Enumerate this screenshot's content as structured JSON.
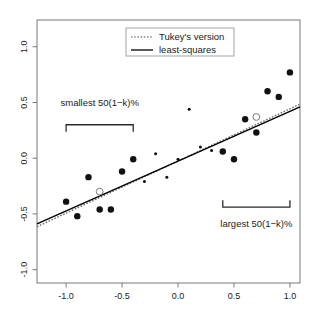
{
  "chart_data": {
    "type": "scatter",
    "title": "",
    "xlabel": "",
    "ylabel": "",
    "xlim": [
      -1.26,
      1.09
    ],
    "ylim": [
      -1.12,
      1.24
    ],
    "grid": false,
    "xticks": [
      -1.0,
      -0.5,
      0.0,
      0.5,
      1.0
    ],
    "xticklabels": [
      "-1.0",
      "-0.5",
      "0.0",
      "0.5",
      "1.0"
    ],
    "yticks": [
      -1.0,
      -0.5,
      0.0,
      0.5,
      1.0
    ],
    "yticklabels": [
      "-1.0",
      "-0.5",
      "0.0",
      "0.5",
      "1.0"
    ],
    "legend": {
      "position": "top-center",
      "entries": [
        {
          "label": "Tukey's version",
          "style": "dotted",
          "color": "#8c8c8c"
        },
        {
          "label": "least-squares",
          "style": "solid",
          "color": "#000000"
        }
      ]
    },
    "series": [
      {
        "name": "large-points",
        "marker": "filled-circle",
        "size": "large",
        "color": "#111111",
        "points": [
          {
            "x": -1.0,
            "y": -0.39
          },
          {
            "x": -0.9,
            "y": -0.52
          },
          {
            "x": -0.8,
            "y": -0.17
          },
          {
            "x": -0.7,
            "y": -0.46
          },
          {
            "x": -0.6,
            "y": -0.46
          },
          {
            "x": -0.5,
            "y": -0.12
          },
          {
            "x": -0.4,
            "y": -0.01
          },
          {
            "x": 0.4,
            "y": 0.06
          },
          {
            "x": 0.5,
            "y": -0.01
          },
          {
            "x": 0.6,
            "y": 0.35
          },
          {
            "x": 0.7,
            "y": 0.23
          },
          {
            "x": 0.8,
            "y": 0.6
          },
          {
            "x": 0.9,
            "y": 0.55
          },
          {
            "x": 1.0,
            "y": 0.77
          }
        ]
      },
      {
        "name": "small-points",
        "marker": "filled-circle",
        "size": "small",
        "color": "#111111",
        "points": [
          {
            "x": -0.3,
            "y": -0.21
          },
          {
            "x": -0.2,
            "y": 0.04
          },
          {
            "x": -0.1,
            "y": -0.17
          },
          {
            "x": 0.0,
            "y": -0.01
          },
          {
            "x": 0.1,
            "y": 0.44
          },
          {
            "x": 0.2,
            "y": 0.1
          },
          {
            "x": 0.3,
            "y": 0.07
          }
        ]
      },
      {
        "name": "centroid-markers",
        "marker": "open-circle",
        "color": "#7a7a7a",
        "points": [
          {
            "x": -0.7,
            "y": -0.3
          },
          {
            "x": 0.7,
            "y": 0.37
          }
        ]
      }
    ],
    "lines": [
      {
        "name": "Tukey's version",
        "style": "dotted",
        "color": "#6e6e6e",
        "x": [
          -1.26,
          1.09
        ],
        "y": [
          -0.615,
          0.485
        ]
      },
      {
        "name": "least-squares",
        "style": "solid",
        "color": "#000000",
        "x": [
          -1.26,
          1.09
        ],
        "y": [
          -0.59,
          0.46
        ]
      }
    ],
    "annotations": [
      {
        "name": "smallest-bracket",
        "text": "smallest 50(1−k)%",
        "bracket": {
          "x_from": -1.0,
          "x_to": -0.4,
          "y": 0.3,
          "direction": "down"
        },
        "text_x": -0.7,
        "text_y": 0.47
      },
      {
        "name": "largest-bracket",
        "text": "largest 50(1−k)%",
        "bracket": {
          "x_from": 0.4,
          "x_to": 1.0,
          "y": -0.44,
          "direction": "up"
        },
        "text_x": 0.7,
        "text_y": -0.62
      }
    ]
  },
  "axis": {
    "x_labels": [
      "-1.0",
      "-0.5",
      "0.0",
      "0.5",
      "1.0"
    ],
    "y_labels": [
      "-1.0",
      "-0.5",
      "0.0",
      "0.5",
      "1.0"
    ]
  },
  "legend": {
    "items": [
      {
        "label": "Tukey's version"
      },
      {
        "label": "least-squares"
      }
    ]
  },
  "annotations": {
    "smallest": "smallest 50(1−k)%",
    "largest": "largest 50(1−k)%"
  },
  "colors": {
    "axis": "#6b6b6b",
    "point": "#111111",
    "tukey_line": "#6e6e6e",
    "ls_line": "#000000",
    "legend_border": "#9a9a9a",
    "text": "#1a1a1a"
  }
}
